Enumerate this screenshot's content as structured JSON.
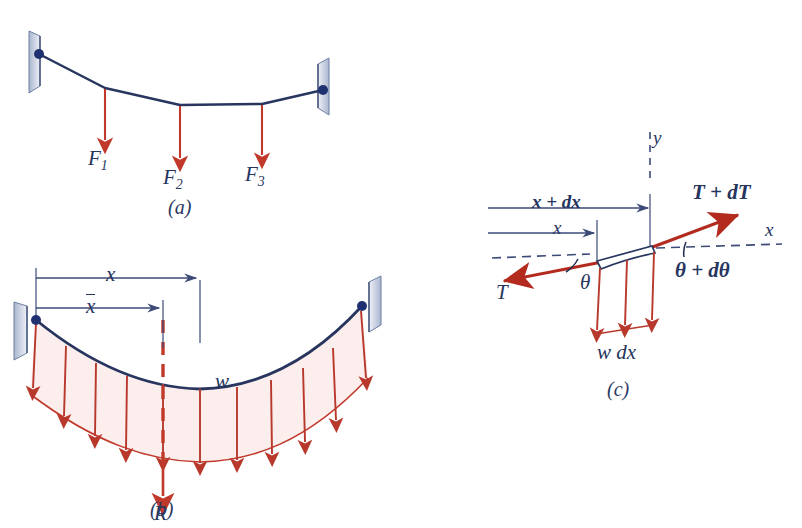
{
  "document": {
    "kind": "engineering-figure-plate",
    "subject": "flexible cables: concentrated loads, distributed load, differential element"
  },
  "colors": {
    "cable": "#27355f",
    "label": "#26355e",
    "load_arrow": "#c0392b",
    "tension_arrow": "#b32b1e",
    "dim_line": "#3c4a78",
    "load_fill": "#fbeeec",
    "support_fill": "#c9d2e4",
    "background": "#ffffff"
  },
  "figures": [
    {
      "id": "a",
      "caption": "(a)",
      "description": "Cable supported at two walls carrying three concentrated vertical loads",
      "supports": [
        "left-wall-pin",
        "right-wall-pin"
      ],
      "loads": [
        {
          "label": "F",
          "subscript": "1"
        },
        {
          "label": "F",
          "subscript": "2"
        },
        {
          "label": "F",
          "subscript": "3"
        }
      ]
    },
    {
      "id": "b",
      "caption": "(b)",
      "description": "Cable carrying a continuous distributed load with resultant R",
      "supports": [
        "left-wall-pin",
        "right-wall-pin"
      ],
      "distributed_load_label": "w",
      "resultant_label": "R",
      "dimensions": [
        {
          "label": "x",
          "overbar": false
        },
        {
          "label": "x",
          "overbar": true
        }
      ],
      "load_arrow_count": 11
    },
    {
      "id": "c",
      "caption": "(c)",
      "description": "Free body diagram of a differential element of the cable",
      "axes": [
        {
          "label": "y",
          "orientation": "vertical"
        },
        {
          "label": "x",
          "orientation": "horizontal"
        }
      ],
      "dimensions": [
        {
          "label": "x + dx"
        },
        {
          "label": "x"
        }
      ],
      "tensions": [
        {
          "label": "T",
          "side": "left"
        },
        {
          "label": "T + dT",
          "side": "right"
        }
      ],
      "angles": [
        {
          "label": "θ",
          "side": "left"
        },
        {
          "label": "θ + dθ",
          "side": "right"
        }
      ],
      "element_load_label": "w dx",
      "element_load_arrow_count": 3
    }
  ]
}
